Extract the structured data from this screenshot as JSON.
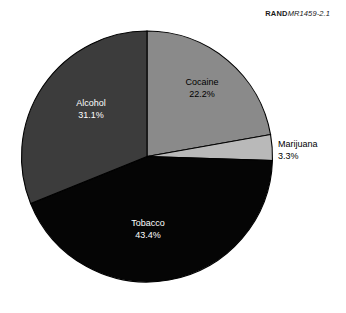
{
  "figure": {
    "id_brand": "RAND",
    "id_number": "MR1459-2.1"
  },
  "chart_data": {
    "type": "pie",
    "title": "",
    "subtitle": "",
    "xlabel": "",
    "ylabel": "",
    "legend_position": "none",
    "grid": false,
    "unit": "%",
    "start_angle_deg": 0,
    "direction": "clockwise",
    "categories": [
      "Cocaine",
      "Marijuana",
      "Tobacco",
      "Alcohol"
    ],
    "values": [
      22.2,
      3.3,
      43.4,
      31.1
    ],
    "slices": [
      {
        "label": "Cocaine",
        "value": 22.2,
        "value_text": "22.2%",
        "color": "#8a8a8a",
        "label_color": "#000000",
        "start_deg": 0,
        "sweep_deg": 79.92
      },
      {
        "label": "Marijuana",
        "value": 3.3,
        "value_text": "3.3%",
        "color": "#b9b9b9",
        "label_color": "#000000",
        "start_deg": 79.92,
        "sweep_deg": 11.88
      },
      {
        "label": "Tobacco",
        "value": 43.4,
        "value_text": "43.4%",
        "color": "#050505",
        "label_color": "#ffffff",
        "start_deg": 91.8,
        "sweep_deg": 156.24
      },
      {
        "label": "Alcohol",
        "value": 31.1,
        "value_text": "31.1%",
        "color": "#3c3c3c",
        "label_color": "#ffffff",
        "start_deg": 248.04,
        "sweep_deg": 111.96
      }
    ]
  }
}
